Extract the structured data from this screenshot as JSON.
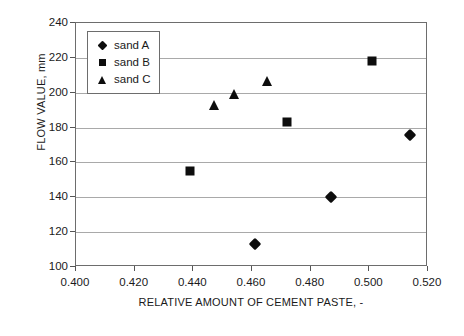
{
  "chart_data": {
    "type": "scatter",
    "title": "",
    "xlabel": "RELATIVE AMOUNT OF CEMENT PASTE, -",
    "ylabel": "FLOW VALUE, mm",
    "xlim": [
      0.4,
      0.52
    ],
    "ylim": [
      100,
      240
    ],
    "xticks": [
      "0.400",
      "0.420",
      "0.440",
      "0.460",
      "0.480",
      "0.500",
      "0.520"
    ],
    "xtick_values": [
      0.4,
      0.42,
      0.44,
      0.46,
      0.48,
      0.5,
      0.52
    ],
    "yticks": [
      "100",
      "120",
      "140",
      "160",
      "180",
      "200",
      "220",
      "240"
    ],
    "ytick_values": [
      100,
      120,
      140,
      160,
      180,
      200,
      220,
      240
    ],
    "grid": "horizontal",
    "legend_position": "top-left-inside",
    "series": [
      {
        "name": "sand A",
        "marker": "diamond",
        "color": "#0d0d0d",
        "points": [
          {
            "x": 0.461,
            "y": 113
          },
          {
            "x": 0.487,
            "y": 140
          },
          {
            "x": 0.514,
            "y": 176
          }
        ]
      },
      {
        "name": "sand B",
        "marker": "square",
        "color": "#0d0d0d",
        "points": [
          {
            "x": 0.439,
            "y": 155
          },
          {
            "x": 0.472,
            "y": 183
          },
          {
            "x": 0.501,
            "y": 218
          }
        ]
      },
      {
        "name": "sand C",
        "marker": "triangle",
        "color": "#0d0d0d",
        "points": [
          {
            "x": 0.447,
            "y": 193
          },
          {
            "x": 0.454,
            "y": 199
          },
          {
            "x": 0.465,
            "y": 207
          }
        ]
      }
    ]
  },
  "legend": {
    "items": [
      {
        "label": "sand A",
        "marker": "diamond"
      },
      {
        "label": "sand B",
        "marker": "square"
      },
      {
        "label": "sand C",
        "marker": "triangle"
      }
    ]
  }
}
